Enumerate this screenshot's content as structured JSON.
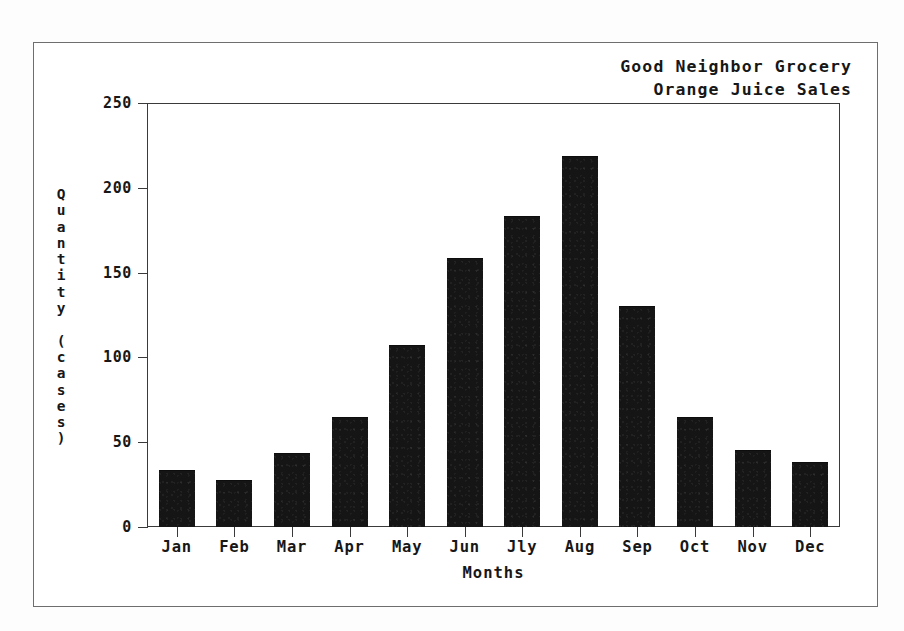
{
  "chart_data": {
    "type": "bar",
    "title": "Good Neighbor Grocery Orange Juice Sales",
    "title_lines": [
      "Good Neighbor Grocery",
      "Orange Juice Sales"
    ],
    "xlabel": "Months",
    "ylabel": "Quantity (cases)",
    "categories": [
      "Jan",
      "Feb",
      "Mar",
      "Apr",
      "May",
      "Jun",
      "Jly",
      "Aug",
      "Sep",
      "Oct",
      "Nov",
      "Dec"
    ],
    "values": [
      33,
      27,
      43,
      64,
      107,
      158,
      183,
      218,
      130,
      64,
      45,
      38
    ],
    "ylim": [
      0,
      250
    ],
    "yticks": [
      0,
      50,
      100,
      150,
      200,
      250
    ],
    "ytick_labels": [
      "0",
      "50",
      "100",
      "150",
      "200",
      "250"
    ],
    "grid": false,
    "legend": null,
    "series": [
      {
        "name": "Orange Juice Sales",
        "values": [
          33,
          27,
          43,
          64,
          107,
          158,
          183,
          218,
          130,
          64,
          45,
          38
        ],
        "color": "#151515"
      }
    ]
  },
  "colors": {
    "bar_fill": "#151515",
    "axis_line": "#3a3a3a",
    "outer_border": "#6e6e6e",
    "text": "#171717",
    "background": "#ffffff"
  },
  "y_axis_title_chars": [
    "Q",
    "u",
    "a",
    "n",
    "t",
    "i",
    "t",
    "y",
    " ",
    "(",
    "c",
    "a",
    "s",
    "e",
    "s",
    ")"
  ]
}
